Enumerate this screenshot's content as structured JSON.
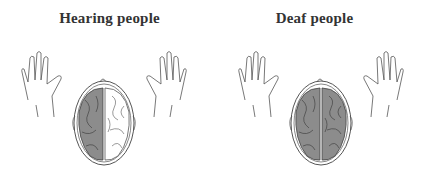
{
  "panels": [
    {
      "title": "Hearing people",
      "left_hemisphere": "shaded",
      "right_hemisphere": "unshaded"
    },
    {
      "title": "Deaf people",
      "left_hemisphere": "shaded",
      "right_hemisphere": "shaded"
    }
  ],
  "colors": {
    "shaded": "#8c8c8c",
    "unshaded": "#ffffff",
    "line": "#555555",
    "title": "#333333"
  }
}
